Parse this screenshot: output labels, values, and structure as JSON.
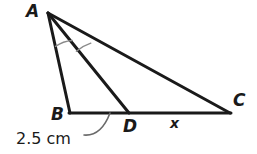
{
  "figure": {
    "kind": "geometry-diagram",
    "background_color": "#ffffff",
    "stroke_color": "#1a1a1a",
    "arc_color": "#7a7a7a",
    "leader_color": "#5a5a5a",
    "points": {
      "A": {
        "label": "A",
        "x": 48,
        "y": 13
      },
      "B": {
        "label": "B",
        "x": 70,
        "y": 113
      },
      "C": {
        "label": "C",
        "x": 230,
        "y": 113
      },
      "D": {
        "label": "D",
        "x": 129,
        "y": 113
      }
    },
    "segments": [
      {
        "name": "AB",
        "from": "A",
        "to": "B"
      },
      {
        "name": "AD",
        "from": "A",
        "to": "D"
      },
      {
        "name": "AC",
        "from": "A",
        "to": "C"
      },
      {
        "name": "BC",
        "from": "B",
        "to": "C"
      }
    ],
    "angle_marks": {
      "vertex": "A",
      "count": 2,
      "meaning": "congruent angles BAD and DAC",
      "radius_inner": 34,
      "radius_outer": 44
    },
    "measurements": [
      {
        "name": "BD",
        "text": "2.5 cm",
        "segment": "B to D",
        "has_leader_line": true
      },
      {
        "name": "DC",
        "text": "x",
        "segment": "D to C",
        "has_leader_line": false
      }
    ]
  }
}
